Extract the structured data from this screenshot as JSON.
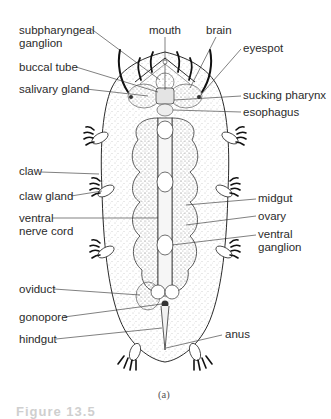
{
  "figure": {
    "panel_label": "(a)",
    "figure_number_partial": "Figure 13.5"
  },
  "labels_left": [
    {
      "id": "subpharyngeal-ganglion",
      "lines": [
        "subpharyngeal",
        "ganglion"
      ]
    },
    {
      "id": "buccal-tube",
      "lines": [
        "buccal tube"
      ]
    },
    {
      "id": "salivary-gland",
      "lines": [
        "salivary gland"
      ]
    },
    {
      "id": "claw",
      "lines": [
        "claw"
      ]
    },
    {
      "id": "claw-gland",
      "lines": [
        "claw gland"
      ]
    },
    {
      "id": "ventral-nerve-cord",
      "lines": [
        "ventral",
        "nerve cord"
      ]
    },
    {
      "id": "oviduct",
      "lines": [
        "oviduct"
      ]
    },
    {
      "id": "gonopore",
      "lines": [
        "gonopore"
      ]
    },
    {
      "id": "hindgut",
      "lines": [
        "hindgut"
      ]
    }
  ],
  "labels_top": [
    {
      "id": "mouth",
      "lines": [
        "mouth"
      ]
    },
    {
      "id": "brain",
      "lines": [
        "brain"
      ]
    }
  ],
  "labels_right": [
    {
      "id": "eyespot",
      "lines": [
        "eyespot"
      ]
    },
    {
      "id": "sucking-pharynx",
      "lines": [
        "sucking pharynx"
      ]
    },
    {
      "id": "esophagus",
      "lines": [
        "esophagus"
      ]
    },
    {
      "id": "midgut",
      "lines": [
        "midgut"
      ]
    },
    {
      "id": "ovary",
      "lines": [
        "ovary"
      ]
    },
    {
      "id": "ventral-ganglion",
      "lines": [
        "ventral",
        "ganglion"
      ]
    },
    {
      "id": "anus",
      "lines": [
        "anus"
      ]
    }
  ],
  "colors": {
    "line": "#2b2b2b",
    "text": "#2b2b2b",
    "stipple": "#9a9a9a",
    "background": "#ffffff"
  }
}
